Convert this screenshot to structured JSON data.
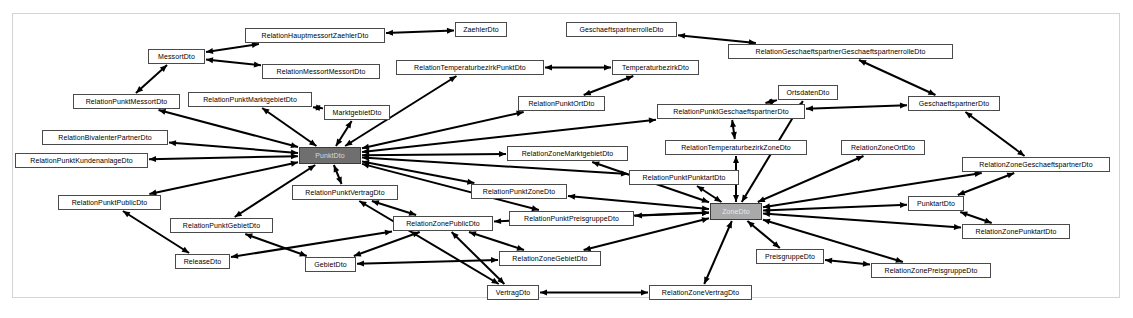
{
  "diagram": {
    "type": "class-dependency-graph",
    "background_color": "#ffffff",
    "frame_border_color": "#d4d4d4",
    "node_fill_color": "#ffffff",
    "node_border_color": "#4a4a4a",
    "edge_color": "#000000",
    "hub_dark_color": "#6f6f6f",
    "hub_light_color": "#a9a9a9",
    "nodes": [
      {
        "id": "MessortDto",
        "label": "MessortDto",
        "x": 148,
        "y": 49,
        "w": 57,
        "h": 15,
        "style": "plain"
      },
      {
        "id": "RelationHauptmessortZaehlerDto",
        "label": "RelationHauptmessortZaehlerDto",
        "x": 245,
        "y": 28,
        "w": 140,
        "h": 15,
        "style": "plain"
      },
      {
        "id": "ZaehlerDto",
        "label": "ZaehlerDto",
        "x": 455,
        "y": 22,
        "w": 52,
        "h": 15,
        "style": "plain"
      },
      {
        "id": "GeschaeftspartnerrolleDto",
        "label": "GeschaeftspartnerrolleDto",
        "x": 566,
        "y": 22,
        "w": 111,
        "h": 15,
        "style": "plain"
      },
      {
        "id": "RelationGeschaeftspartnerGeschaeftspartnerrolleDto",
        "label": "RelationGeschaeftspartnerGeschaeftspartnerrolleDto",
        "x": 728,
        "y": 44,
        "w": 225,
        "h": 15,
        "style": "plain"
      },
      {
        "id": "RelationMessortMessortDto",
        "label": "RelationMessortMessortDto",
        "x": 262,
        "y": 64,
        "w": 118,
        "h": 15,
        "style": "plain"
      },
      {
        "id": "RelationTemperaturbezirkPunktDto",
        "label": "RelationTemperaturbezirkPunktDto",
        "x": 396,
        "y": 60,
        "w": 148,
        "h": 15,
        "style": "plain"
      },
      {
        "id": "TemperaturbezirkDto",
        "label": "TemperaturbezirkDto",
        "x": 612,
        "y": 60,
        "w": 87,
        "h": 15,
        "style": "plain"
      },
      {
        "id": "RelationPunktMessortDto",
        "label": "RelationPunktMessortDto",
        "x": 73,
        "y": 94,
        "w": 107,
        "h": 15,
        "style": "plain"
      },
      {
        "id": "RelationPunktMarktgebietDto",
        "label": "RelationPunktMarktgebietDto",
        "x": 188,
        "y": 92,
        "w": 124,
        "h": 15,
        "style": "plain"
      },
      {
        "id": "MarktgebietDto",
        "label": "MarktgebietDto",
        "x": 324,
        "y": 105,
        "w": 66,
        "h": 15,
        "style": "plain"
      },
      {
        "id": "RelationPunktOrtDto",
        "label": "RelationPunktOrtDto",
        "x": 518,
        "y": 96,
        "w": 87,
        "h": 15,
        "style": "plain"
      },
      {
        "id": "OrtsdatenDto",
        "label": "OrtsdatenDto",
        "x": 778,
        "y": 85,
        "w": 60,
        "h": 15,
        "style": "plain"
      },
      {
        "id": "RelationPunktGeschaeftspartnerDto",
        "label": "RelationPunktGeschaeftspartnerDto",
        "x": 657,
        "y": 104,
        "w": 148,
        "h": 15,
        "style": "plain"
      },
      {
        "id": "GeschaeftspartnerDto",
        "label": "GeschaeftspartnerDto",
        "x": 908,
        "y": 96,
        "w": 92,
        "h": 15,
        "style": "plain"
      },
      {
        "id": "RelationBivalenterPartnerDto",
        "label": "RelationBivalenterPartnerDto",
        "x": 42,
        "y": 130,
        "w": 126,
        "h": 15,
        "style": "plain"
      },
      {
        "id": "RelationZoneMarktgebietDto",
        "label": "RelationZoneMarktgebietDto",
        "x": 507,
        "y": 146,
        "w": 121,
        "h": 15,
        "style": "plain"
      },
      {
        "id": "RelationTemperaturbezirkZoneDto",
        "label": "RelationTemperaturbezirkZoneDto",
        "x": 665,
        "y": 140,
        "w": 142,
        "h": 15,
        "style": "plain"
      },
      {
        "id": "RelationZoneOrtDto",
        "label": "RelationZoneOrtDto",
        "x": 841,
        "y": 140,
        "w": 84,
        "h": 15,
        "style": "plain"
      },
      {
        "id": "RelationZoneGeschaeftspartnerDto",
        "label": "RelationZoneGeschaeftspartnerDto",
        "x": 962,
        "y": 157,
        "w": 148,
        "h": 15,
        "style": "plain"
      },
      {
        "id": "RelationPunktKundenanlageDto",
        "label": "RelationPunktKundenanlageDto",
        "x": 15,
        "y": 153,
        "w": 133,
        "h": 15,
        "style": "plain"
      },
      {
        "id": "PunktDto",
        "label": "PunktDto",
        "x": 299,
        "y": 147,
        "w": 62,
        "h": 17,
        "style": "hub-dark"
      },
      {
        "id": "RelationPunktPunktartDto",
        "label": "RelationPunktPunktartDto",
        "x": 629,
        "y": 170,
        "w": 110,
        "h": 15,
        "style": "plain"
      },
      {
        "id": "RelationPunktVertragDto",
        "label": "RelationPunktVertragDto",
        "x": 292,
        "y": 185,
        "w": 106,
        "h": 15,
        "style": "plain"
      },
      {
        "id": "RelationPunktZoneDto",
        "label": "RelationPunktZoneDto",
        "x": 471,
        "y": 184,
        "w": 96,
        "h": 15,
        "style": "plain"
      },
      {
        "id": "PunktartDto",
        "label": "PunktartDto",
        "x": 908,
        "y": 196,
        "w": 56,
        "h": 15,
        "style": "plain"
      },
      {
        "id": "RelationPunktPublicDto",
        "label": "RelationPunktPublicDto",
        "x": 58,
        "y": 195,
        "w": 103,
        "h": 15,
        "style": "plain"
      },
      {
        "id": "ZoneDto",
        "label": "ZoneDto",
        "x": 710,
        "y": 203,
        "w": 52,
        "h": 17,
        "style": "hub-light"
      },
      {
        "id": "RelationPunktPreisgruppeDto",
        "label": "RelationPunktPreisgruppeDto",
        "x": 509,
        "y": 211,
        "w": 125,
        "h": 15,
        "style": "plain"
      },
      {
        "id": "RelationZonePunktartDto",
        "label": "RelationZonePunktartDto",
        "x": 962,
        "y": 224,
        "w": 108,
        "h": 15,
        "style": "plain"
      },
      {
        "id": "RelationPunktGebietDto",
        "label": "RelationPunktGebietDto",
        "x": 170,
        "y": 218,
        "w": 103,
        "h": 15,
        "style": "plain"
      },
      {
        "id": "RelationZonePublicDto",
        "label": "RelationZonePublicDto",
        "x": 393,
        "y": 216,
        "w": 100,
        "h": 15,
        "style": "plain"
      },
      {
        "id": "PreisgruppeDto",
        "label": "PreisgruppeDto",
        "x": 756,
        "y": 249,
        "w": 68,
        "h": 15,
        "style": "plain"
      },
      {
        "id": "ReleaseDto",
        "label": "ReleaseDto",
        "x": 175,
        "y": 254,
        "w": 55,
        "h": 15,
        "style": "plain"
      },
      {
        "id": "GebietDto",
        "label": "GebietDto",
        "x": 305,
        "y": 257,
        "w": 51,
        "h": 15,
        "style": "plain"
      },
      {
        "id": "RelationZoneGebietDto",
        "label": "RelationZoneGebietDto",
        "x": 499,
        "y": 251,
        "w": 102,
        "h": 15,
        "style": "plain"
      },
      {
        "id": "RelationZonePreisgruppeDto",
        "label": "RelationZonePreisgruppeDto",
        "x": 871,
        "y": 263,
        "w": 120,
        "h": 15,
        "style": "plain"
      },
      {
        "id": "VertragDto",
        "label": "VertragDto",
        "x": 487,
        "y": 285,
        "w": 52,
        "h": 15,
        "style": "plain"
      },
      {
        "id": "RelationZoneVertragDto",
        "label": "RelationZoneVertragDto",
        "x": 649,
        "y": 285,
        "w": 103,
        "h": 15,
        "style": "plain"
      }
    ],
    "edges": [
      {
        "from": "RelationHauptmessortZaehlerDto",
        "to": "MessortDto",
        "arrow": "both"
      },
      {
        "from": "ZaehlerDto",
        "to": "RelationHauptmessortZaehlerDto",
        "arrow": "both"
      },
      {
        "from": "RelationMessortMessortDto",
        "to": "MessortDto",
        "arrow": "both"
      },
      {
        "from": "RelationPunktMessortDto",
        "to": "MessortDto",
        "arrow": "both"
      },
      {
        "from": "RelationGeschaeftspartnerGeschaeftspartnerrolleDto",
        "to": "GeschaeftspartnerrolleDto",
        "arrow": "both"
      },
      {
        "from": "RelationGeschaeftspartnerGeschaeftspartnerrolleDto",
        "to": "GeschaeftspartnerDto",
        "arrow": "both"
      },
      {
        "from": "TemperaturbezirkDto",
        "to": "RelationTemperaturbezirkPunktDto",
        "arrow": "both"
      },
      {
        "from": "PunktDto",
        "to": "RelationTemperaturbezirkPunktDto",
        "arrow": "both"
      },
      {
        "from": "RelationPunktMarktgebietDto",
        "to": "MarktgebietDto",
        "arrow": "both"
      },
      {
        "from": "PunktDto",
        "to": "RelationPunktMarktgebietDto",
        "arrow": "both"
      },
      {
        "from": "PunktDto",
        "to": "MarktgebietDto",
        "arrow": "both"
      },
      {
        "from": "PunktDto",
        "to": "RelationPunktMessortDto",
        "arrow": "both"
      },
      {
        "from": "PunktDto",
        "to": "RelationBivalenterPartnerDto",
        "arrow": "both"
      },
      {
        "from": "PunktDto",
        "to": "RelationPunktKundenanlageDto",
        "arrow": "both"
      },
      {
        "from": "PunktDto",
        "to": "RelationPunktOrtDto",
        "arrow": "both"
      },
      {
        "from": "PunktDto",
        "to": "RelationPunktGeschaeftspartnerDto",
        "arrow": "both"
      },
      {
        "from": "PunktDto",
        "to": "RelationPunktPublicDto",
        "arrow": "both"
      },
      {
        "from": "PunktDto",
        "to": "RelationPunktGebietDto",
        "arrow": "both"
      },
      {
        "from": "PunktDto",
        "to": "RelationPunktVertragDto",
        "arrow": "both"
      },
      {
        "from": "PunktDto",
        "to": "RelationPunktZoneDto",
        "arrow": "both"
      },
      {
        "from": "PunktDto",
        "to": "RelationPunktPreisgruppeDto",
        "arrow": "both"
      },
      {
        "from": "PunktDto",
        "to": "RelationPunktPunktartDto",
        "arrow": "both"
      },
      {
        "from": "PunktDto",
        "to": "RelationZoneMarktgebietDto",
        "arrow": "both"
      },
      {
        "from": "TemperaturbezirkDto",
        "to": "RelationPunktOrtDto",
        "arrow": "both"
      },
      {
        "from": "RelationPunktGeschaeftspartnerDto",
        "to": "OrtsdatenDto",
        "arrow": "both"
      },
      {
        "from": "RelationPunktGeschaeftspartnerDto",
        "to": "GeschaeftspartnerDto",
        "arrow": "both"
      },
      {
        "from": "RelationPunktGeschaeftspartnerDto",
        "to": "RelationTemperaturbezirkZoneDto",
        "arrow": "both"
      },
      {
        "from": "ZoneDto",
        "to": "OrtsdatenDto",
        "arrow": "both"
      },
      {
        "from": "ZoneDto",
        "to": "RelationZoneOrtDto",
        "arrow": "both"
      },
      {
        "from": "ZoneDto",
        "to": "RelationTemperaturbezirkZoneDto",
        "arrow": "both"
      },
      {
        "from": "ZoneDto",
        "to": "RelationZoneMarktgebietDto",
        "arrow": "both"
      },
      {
        "from": "ZoneDto",
        "to": "RelationPunktZoneDto",
        "arrow": "both"
      },
      {
        "from": "ZoneDto",
        "to": "RelationPunktPunktartDto",
        "arrow": "both"
      },
      {
        "from": "ZoneDto",
        "to": "RelationZoneGeschaeftspartnerDto",
        "arrow": "both"
      },
      {
        "from": "ZoneDto",
        "to": "PunktartDto",
        "arrow": "both"
      },
      {
        "from": "ZoneDto",
        "to": "RelationZonePunktartDto",
        "arrow": "both"
      },
      {
        "from": "ZoneDto",
        "to": "RelationPunktPreisgruppeDto",
        "arrow": "both"
      },
      {
        "from": "ZoneDto",
        "to": "PreisgruppeDto",
        "arrow": "both"
      },
      {
        "from": "ZoneDto",
        "to": "RelationZonePreisgruppeDto",
        "arrow": "both"
      },
      {
        "from": "ZoneDto",
        "to": "RelationZoneGebietDto",
        "arrow": "both"
      },
      {
        "from": "ZoneDto",
        "to": "RelationZonePublicDto",
        "arrow": "both"
      },
      {
        "from": "ZoneDto",
        "to": "RelationZoneVertragDto",
        "arrow": "both"
      },
      {
        "from": "RelationZoneGeschaeftspartnerDto",
        "to": "GeschaeftspartnerDto",
        "arrow": "both"
      },
      {
        "from": "RelationZoneGeschaeftspartnerDto",
        "to": "PunktartDto",
        "arrow": "both"
      },
      {
        "from": "RelationZonePunktartDto",
        "to": "PunktartDto",
        "arrow": "both"
      },
      {
        "from": "RelationZonePreisgruppeDto",
        "to": "PreisgruppeDto",
        "arrow": "both"
      },
      {
        "from": "RelationPunktPublicDto",
        "to": "ReleaseDto",
        "arrow": "both"
      },
      {
        "from": "RelationPunktGebietDto",
        "to": "GebietDto",
        "arrow": "both"
      },
      {
        "from": "RelationZonePublicDto",
        "to": "ReleaseDto",
        "arrow": "both"
      },
      {
        "from": "RelationZonePublicDto",
        "to": "GebietDto",
        "arrow": "both"
      },
      {
        "from": "RelationZonePublicDto",
        "to": "RelationPunktVertragDto",
        "arrow": "both"
      },
      {
        "from": "RelationZonePublicDto",
        "to": "VertragDto",
        "arrow": "both"
      },
      {
        "from": "RelationZonePublicDto",
        "to": "RelationZoneGebietDto",
        "arrow": "both"
      },
      {
        "from": "RelationZoneGebietDto",
        "to": "GebietDto",
        "arrow": "both"
      },
      {
        "from": "RelationZoneVertragDto",
        "to": "VertragDto",
        "arrow": "both"
      },
      {
        "from": "RelationPunktVertragDto",
        "to": "VertragDto",
        "arrow": "both"
      }
    ]
  }
}
